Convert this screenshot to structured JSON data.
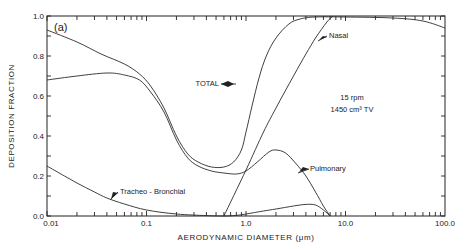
{
  "chart_data": {
    "type": "line",
    "panel_label": "(a)",
    "title": "",
    "xlabel": "AERODYNAMIC  DIAMETER (μm)",
    "ylabel": "DEPOSITION  FRACTION",
    "xscale": "log",
    "xlim": [
      0.01,
      100.0
    ],
    "ylim": [
      0.0,
      1.0
    ],
    "x_tick_labels": [
      "0.01",
      "0.1",
      "1.0",
      "10.0",
      "100.0"
    ],
    "x_tick_values": [
      0.01,
      0.1,
      1.0,
      10.0,
      100.0
    ],
    "y_tick_labels": [
      "0.0",
      "0.2",
      "0.4",
      "0.6",
      "0.8",
      "1.0"
    ],
    "y_tick_values": [
      0.0,
      0.2,
      0.4,
      0.6,
      0.8,
      1.0
    ],
    "grid": false,
    "conditions": [
      "15 rpm",
      "1450 cm³ TV"
    ],
    "series": [
      {
        "name": "TOTAL",
        "label": "TOTAL",
        "points": [
          [
            0.01,
            0.93
          ],
          [
            0.02,
            0.87
          ],
          [
            0.035,
            0.81
          ],
          [
            0.06,
            0.76
          ],
          [
            0.085,
            0.71
          ],
          [
            0.11,
            0.65
          ],
          [
            0.15,
            0.54
          ],
          [
            0.2,
            0.4
          ],
          [
            0.26,
            0.31
          ],
          [
            0.33,
            0.27
          ],
          [
            0.45,
            0.245
          ],
          [
            0.6,
            0.245
          ],
          [
            0.75,
            0.27
          ],
          [
            0.9,
            0.33
          ],
          [
            1.0,
            0.42
          ],
          [
            1.15,
            0.55
          ],
          [
            1.35,
            0.69
          ],
          [
            1.6,
            0.8
          ],
          [
            2.0,
            0.89
          ],
          [
            2.7,
            0.96
          ],
          [
            3.5,
            0.985
          ],
          [
            5.0,
            0.995
          ],
          [
            10.0,
            0.995
          ],
          [
            30.0,
            0.99
          ],
          [
            60.0,
            0.975
          ],
          [
            100.0,
            0.94
          ]
        ]
      },
      {
        "name": "Pulmonary",
        "label": "Pulmonary",
        "points": [
          [
            0.01,
            0.68
          ],
          [
            0.02,
            0.7
          ],
          [
            0.04,
            0.715
          ],
          [
            0.06,
            0.705
          ],
          [
            0.085,
            0.68
          ],
          [
            0.11,
            0.62
          ],
          [
            0.15,
            0.52
          ],
          [
            0.2,
            0.38
          ],
          [
            0.26,
            0.29
          ],
          [
            0.33,
            0.25
          ],
          [
            0.45,
            0.225
          ],
          [
            0.6,
            0.215
          ],
          [
            0.8,
            0.21
          ],
          [
            1.0,
            0.225
          ],
          [
            1.3,
            0.27
          ],
          [
            1.7,
            0.32
          ],
          [
            2.0,
            0.33
          ],
          [
            2.5,
            0.315
          ],
          [
            3.2,
            0.26
          ],
          [
            4.0,
            0.2
          ],
          [
            5.0,
            0.12
          ],
          [
            6.0,
            0.05
          ],
          [
            7.0,
            0.0
          ]
        ]
      },
      {
        "name": "Nasal",
        "label": "Nasal",
        "points": [
          [
            0.6,
            0.0
          ],
          [
            1.0,
            0.23
          ],
          [
            1.5,
            0.42
          ],
          [
            2.0,
            0.54
          ],
          [
            3.0,
            0.7
          ],
          [
            4.0,
            0.81
          ],
          [
            5.0,
            0.89
          ],
          [
            6.5,
            0.97
          ],
          [
            7.5,
            1.0
          ]
        ]
      },
      {
        "name": "Tracheo-Bronchial",
        "label": "Tracheo - Bronchial",
        "points": [
          [
            0.01,
            0.25
          ],
          [
            0.015,
            0.2
          ],
          [
            0.02,
            0.165
          ],
          [
            0.03,
            0.12
          ],
          [
            0.04,
            0.09
          ],
          [
            0.06,
            0.06
          ],
          [
            0.1,
            0.03
          ],
          [
            0.2,
            0.01
          ],
          [
            0.4,
            0.002
          ],
          [
            0.6,
            0.0
          ],
          [
            0.8,
            0.003
          ],
          [
            1.0,
            0.01
          ],
          [
            1.5,
            0.025
          ],
          [
            2.0,
            0.035
          ],
          [
            3.0,
            0.05
          ],
          [
            4.0,
            0.058
          ],
          [
            5.0,
            0.055
          ],
          [
            6.0,
            0.03
          ],
          [
            7.0,
            0.0
          ]
        ]
      }
    ],
    "annotations": [
      {
        "text": "TOTAL",
        "points_to": "TOTAL",
        "at_x": 1.05
      },
      {
        "text": "Nasal",
        "points_to": "Nasal",
        "at_x": 5.0
      },
      {
        "text": "Pulmonary",
        "points_to": "Pulmonary",
        "at_x": 4.2
      },
      {
        "text": "Tracheo - Bronchial",
        "points_to": "Tracheo-Bronchial",
        "at_x": 0.04
      }
    ]
  }
}
